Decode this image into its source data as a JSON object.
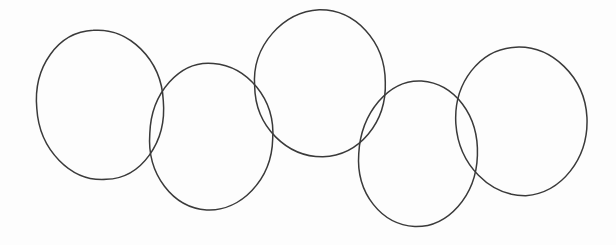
{
  "figure": {
    "background_color": "#fdfdfd",
    "stroke_color": "#3a3a3a",
    "stroke_width": 1.5,
    "canvas": {
      "width": 616,
      "height": 245
    }
  },
  "chart_data": {
    "type": "scatter",
    "xlabel": "",
    "ylabel": "",
    "xlim": [
      0,
      616
    ],
    "ylim": [
      0,
      245
    ],
    "grid": false,
    "legend": "none",
    "shape": "ellipse",
    "count": 5,
    "categories": [
      "circle-1",
      "circle-2",
      "circle-3",
      "circle-4",
      "circle-5"
    ],
    "series": [
      {
        "name": "center-x",
        "values": [
          100,
          211,
          321,
          418,
          521
        ]
      },
      {
        "name": "center-y",
        "values": [
          105,
          136,
          84,
          155,
          121
        ]
      },
      {
        "name": "radius-x",
        "values": [
          64,
          61,
          65,
          60,
          65
        ]
      },
      {
        "name": "radius-y",
        "values": [
          75,
          74,
          74,
          73,
          74
        ]
      },
      {
        "name": "rotation-deg",
        "values": [
          -4,
          3,
          -2,
          2,
          -3
        ]
      }
    ],
    "ellipses": [
      {
        "id": "circle-1",
        "cx": 100,
        "cy": 105,
        "rx": 64,
        "ry": 75,
        "rotation": -4,
        "bounds": {
          "left": 36,
          "top": 31,
          "right": 164,
          "bottom": 180
        }
      },
      {
        "id": "circle-2",
        "cx": 211,
        "cy": 136,
        "rx": 61,
        "ry": 74,
        "rotation": 3,
        "bounds": {
          "left": 150,
          "top": 62,
          "right": 272,
          "bottom": 210
        }
      },
      {
        "id": "circle-3",
        "cx": 321,
        "cy": 84,
        "rx": 65,
        "ry": 74,
        "rotation": -2,
        "bounds": {
          "left": 256,
          "top": 10,
          "right": 386,
          "bottom": 158
        }
      },
      {
        "id": "circle-4",
        "cx": 418,
        "cy": 155,
        "rx": 60,
        "ry": 73,
        "rotation": 2,
        "bounds": {
          "left": 358,
          "top": 83,
          "right": 478,
          "bottom": 228
        }
      },
      {
        "id": "circle-5",
        "cx": 521,
        "cy": 121,
        "rx": 65,
        "ry": 74,
        "rotation": -3,
        "bounds": {
          "left": 456,
          "top": 47,
          "right": 586,
          "bottom": 195
        }
      }
    ]
  }
}
